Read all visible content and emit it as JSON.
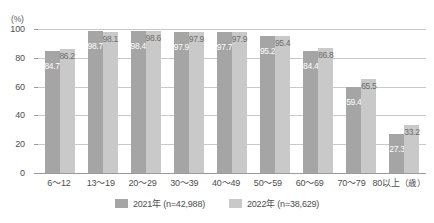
{
  "chart_data": {
    "type": "bar",
    "title": "",
    "xlabel": "(歳)",
    "ylabel": "(%)",
    "ylim": [
      0,
      100
    ],
    "yticks": [
      0,
      20,
      40,
      60,
      80,
      100
    ],
    "grid": true,
    "legend_position": "bottom-center",
    "categories": [
      "6〜12",
      "13〜19",
      "20〜29",
      "30〜39",
      "40〜49",
      "50〜59",
      "60〜69",
      "70〜79",
      "80以上"
    ],
    "series": [
      {
        "name": "2021年（n=42,988）",
        "short_name": "2021年",
        "sample_size": "(n=42,988)",
        "color": "#a5a5a5",
        "values": [
          84.7,
          98.7,
          98.4,
          97.9,
          97.7,
          95.2,
          84.4,
          59.4,
          27.3
        ]
      },
      {
        "name": "2022年（n=38,629）",
        "short_name": "2022年",
        "sample_size": "(n=38,629)",
        "color": "#c9c9c9",
        "values": [
          86.2,
          98.1,
          98.6,
          97.9,
          97.9,
          95.4,
          86.8,
          65.5,
          33.2
        ]
      }
    ]
  },
  "axis": {
    "unit_top": "(%)",
    "unit_x": "（歳）",
    "tick_labels": [
      "100",
      "80",
      "60",
      "40",
      "20",
      "0"
    ]
  },
  "colors": {
    "series_2021": "#a5a5a5",
    "series_2022": "#c9c9c9",
    "gridline": "#c9c9c9",
    "axis": "#9a9a9a",
    "text": "#4d4d4d"
  }
}
